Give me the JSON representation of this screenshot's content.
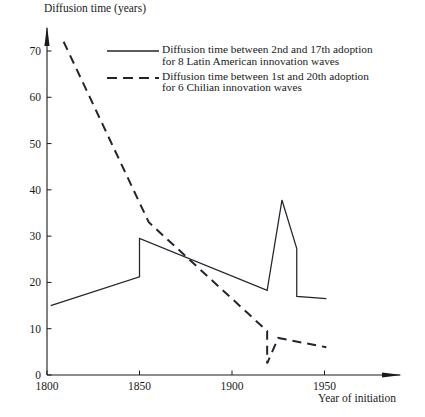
{
  "chart_data": {
    "type": "line",
    "title": "",
    "ylabel": "Diffusion time (years)",
    "xlabel": "Year of initiation",
    "xlim": [
      1800,
      1975
    ],
    "ylim": [
      0,
      74
    ],
    "xticks": [
      1800,
      1850,
      1900,
      1950
    ],
    "xtick_labels": [
      "1800",
      "1850",
      "1900",
      "1950"
    ],
    "yticks": [
      0,
      10,
      20,
      30,
      40,
      50,
      60,
      70
    ],
    "ytick_labels": [
      "0",
      "10",
      "20",
      "30",
      "40",
      "50",
      "60",
      "70"
    ],
    "grid": false,
    "legend_position": "upper center",
    "series": [
      {
        "name": "latin-american",
        "style": "solid",
        "color": "#24242e",
        "legend_line1": "Diffusion time between 2nd and 17th adoption",
        "legend_line2": "for 8 Latin American innovation waves",
        "points": [
          {
            "x": 1802,
            "y": 15.0
          },
          {
            "x": 1850,
            "y": 21.2
          },
          {
            "x": 1850,
            "y": 29.5
          },
          {
            "x": 1919,
            "y": 18.3
          },
          {
            "x": 1919,
            "y": 18.3
          },
          {
            "x": 1927,
            "y": 37.8
          },
          {
            "x": 1935,
            "y": 27.3
          },
          {
            "x": 1935,
            "y": 17.0
          },
          {
            "x": 1951,
            "y": 16.5
          }
        ]
      },
      {
        "name": "chilean",
        "style": "dashed",
        "color": "#24242e",
        "legend_line1": "Diffusion time between 1st and 20th adoption",
        "legend_line2": "for 6 Chilian innovation waves",
        "points": [
          {
            "x": 1809,
            "y": 72.0
          },
          {
            "x": 1855,
            "y": 33.0
          },
          {
            "x": 1919,
            "y": 9.5
          },
          {
            "x": 1919,
            "y": 2.5
          },
          {
            "x": 1925,
            "y": 8.0
          },
          {
            "x": 1951,
            "y": 6.0
          }
        ]
      }
    ]
  }
}
